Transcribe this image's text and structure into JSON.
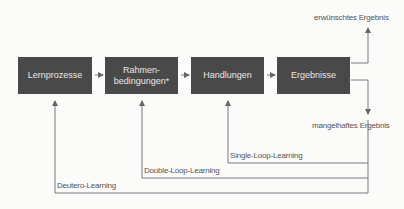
{
  "diagram": {
    "nodes": [
      {
        "id": "lernprozesse",
        "label": "Lernprozesse"
      },
      {
        "id": "rahmenbedingungen",
        "label": "Rahmen-\nbedingungen*"
      },
      {
        "id": "handlungen",
        "label": "Handlungen"
      },
      {
        "id": "ergebnisse",
        "label": "Ergebnisse"
      }
    ],
    "outcomes": {
      "desired": "erwünschtes Ergebnis",
      "deficient": "mangelhaftes Ergebnis"
    },
    "loops": {
      "single": "Single-Loop-Learning",
      "double": "Double-Loop-Learning",
      "deutero": "Deutero-Learning"
    },
    "colors": {
      "box": "#4a4949",
      "line": "#7a7a7a",
      "text": "#555555"
    }
  }
}
